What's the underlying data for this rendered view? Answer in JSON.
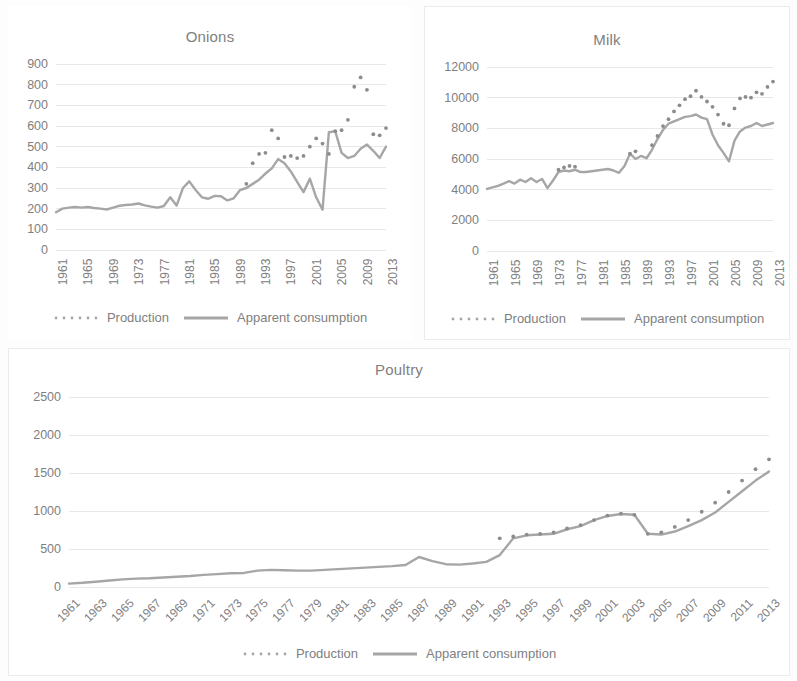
{
  "figure": {
    "legend_labels": {
      "production": "Production",
      "consumption": "Apparent consumption"
    },
    "colors": {
      "series": "#a6a6a6",
      "text": "#808080",
      "gridline": "#e8e8e8",
      "panel_border": "#eceaea",
      "background": "#ffffff"
    }
  },
  "chart_data": [
    {
      "id": "onions",
      "type": "line",
      "title": "Onions",
      "xlabel": "",
      "ylabel": "",
      "ylim": [
        0,
        900
      ],
      "yticks": [
        0,
        100,
        200,
        300,
        400,
        500,
        600,
        700,
        800,
        900
      ],
      "grid": true,
      "legend_position": "bottom",
      "xtick_step": 4,
      "xtick_rotation": -90,
      "xticks": [
        "1961",
        "1965",
        "1969",
        "1973",
        "1977",
        "1981",
        "1985",
        "1989",
        "1993",
        "1997",
        "2001",
        "2005",
        "2009",
        "2013"
      ],
      "x": [
        1961,
        1962,
        1963,
        1964,
        1965,
        1966,
        1967,
        1968,
        1969,
        1970,
        1971,
        1972,
        1973,
        1974,
        1975,
        1976,
        1977,
        1978,
        1979,
        1980,
        1981,
        1982,
        1983,
        1984,
        1985,
        1986,
        1987,
        1988,
        1989,
        1990,
        1991,
        1992,
        1993,
        1994,
        1995,
        1996,
        1997,
        1998,
        1999,
        2000,
        2001,
        2002,
        2003,
        2004,
        2005,
        2006,
        2007,
        2008,
        2009,
        2010,
        2011,
        2012,
        2013
      ],
      "series": [
        {
          "name": "Apparent consumption",
          "style": "solid-line",
          "values": [
            183,
            200,
            205,
            208,
            205,
            208,
            203,
            200,
            196,
            205,
            214,
            218,
            220,
            225,
            216,
            210,
            205,
            213,
            255,
            215,
            300,
            332,
            290,
            255,
            248,
            262,
            260,
            240,
            250,
            290,
            300,
            320,
            340,
            370,
            395,
            440,
            420,
            380,
            330,
            280,
            345,
            255,
            195,
            570,
            575,
            470,
            445,
            455,
            490,
            510,
            480,
            445,
            500,
            470,
            490,
            465,
            455,
            480,
            485,
            560,
            500
          ]
        },
        {
          "name": "Production",
          "style": "dotted",
          "values": [
            null,
            null,
            null,
            null,
            null,
            null,
            null,
            null,
            null,
            null,
            null,
            null,
            null,
            null,
            null,
            null,
            null,
            null,
            null,
            null,
            null,
            null,
            null,
            null,
            null,
            null,
            null,
            null,
            null,
            null,
            320,
            420,
            465,
            470,
            580,
            540,
            450,
            455,
            445,
            455,
            500,
            540,
            515,
            465,
            575,
            580,
            630,
            790,
            835,
            775,
            560,
            555,
            590,
            625,
            660,
            700,
            740,
            715,
            690,
            670,
            640,
            705,
            715
          ]
        }
      ]
    },
    {
      "id": "milk",
      "type": "line",
      "title": "Milk",
      "xlabel": "",
      "ylabel": "",
      "ylim": [
        0,
        12000
      ],
      "yticks": [
        0,
        2000,
        4000,
        6000,
        8000,
        10000,
        12000
      ],
      "grid": true,
      "legend_position": "bottom",
      "xtick_step": 4,
      "xtick_rotation": -90,
      "xticks": [
        "1961",
        "1965",
        "1969",
        "1973",
        "1977",
        "1981",
        "1985",
        "1989",
        "1993",
        "1997",
        "2001",
        "2005",
        "2009",
        "2013"
      ],
      "x": [
        1961,
        1962,
        1963,
        1964,
        1965,
        1966,
        1967,
        1968,
        1969,
        1970,
        1971,
        1972,
        1973,
        1974,
        1975,
        1976,
        1977,
        1978,
        1979,
        1980,
        1981,
        1982,
        1983,
        1984,
        1985,
        1986,
        1987,
        1988,
        1989,
        1990,
        1991,
        1992,
        1993,
        1994,
        1995,
        1996,
        1997,
        1998,
        1999,
        2000,
        2001,
        2002,
        2003,
        2004,
        2005,
        2006,
        2007,
        2008,
        2009,
        2010,
        2011,
        2012,
        2013
      ],
      "series": [
        {
          "name": "Apparent consumption",
          "style": "solid-line",
          "values": [
            4050,
            4150,
            4250,
            4400,
            4550,
            4400,
            4650,
            4500,
            4750,
            4500,
            4700,
            4100,
            4600,
            5150,
            5250,
            5200,
            5300,
            5150,
            5150,
            5200,
            5250,
            5300,
            5350,
            5250,
            5100,
            5550,
            6350,
            6000,
            6200,
            6050,
            6600,
            7300,
            7900,
            8300,
            8450,
            8600,
            8750,
            8800,
            8900,
            8700,
            8600,
            7600,
            6900,
            6400,
            5850,
            7200,
            7800,
            8050,
            8150,
            8350,
            8150,
            8250,
            8350
          ]
        },
        {
          "name": "Production",
          "style": "dotted",
          "values": [
            null,
            null,
            null,
            null,
            null,
            null,
            null,
            null,
            null,
            null,
            null,
            null,
            null,
            5300,
            5450,
            5550,
            5500,
            null,
            null,
            null,
            null,
            null,
            null,
            null,
            null,
            null,
            6350,
            6500,
            null,
            null,
            6900,
            7500,
            8150,
            8600,
            9100,
            9500,
            9900,
            10100,
            10450,
            10050,
            9750,
            9400,
            8900,
            8300,
            8200,
            9300,
            9950,
            10050,
            10000,
            10350,
            10250,
            10700,
            11050
          ]
        }
      ]
    },
    {
      "id": "poultry",
      "type": "line",
      "title": "Poultry",
      "xlabel": "",
      "ylabel": "",
      "ylim": [
        0,
        2500
      ],
      "yticks": [
        0,
        500,
        1000,
        1500,
        2000,
        2500
      ],
      "grid": true,
      "legend_position": "bottom",
      "xtick_step": 2,
      "xtick_rotation": -45,
      "xticks": [
        "1961",
        "1963",
        "1965",
        "1967",
        "1969",
        "1971",
        "1973",
        "1975",
        "1977",
        "1979",
        "1981",
        "1983",
        "1985",
        "1987",
        "1989",
        "1991",
        "1993",
        "1995",
        "1997",
        "1999",
        "2001",
        "2003",
        "2005",
        "2007",
        "2009",
        "2011",
        "2013"
      ],
      "x": [
        1961,
        1962,
        1963,
        1964,
        1965,
        1966,
        1967,
        1968,
        1969,
        1970,
        1971,
        1972,
        1973,
        1974,
        1975,
        1976,
        1977,
        1978,
        1979,
        1980,
        1981,
        1982,
        1983,
        1984,
        1985,
        1986,
        1987,
        1988,
        1989,
        1990,
        1991,
        1992,
        1993,
        1994,
        1995,
        1996,
        1997,
        1998,
        1999,
        2000,
        2001,
        2002,
        2003,
        2004,
        2005,
        2006,
        2007,
        2008,
        2009,
        2010,
        2011,
        2012,
        2013
      ],
      "series": [
        {
          "name": "Apparent consumption",
          "style": "solid-line",
          "values": [
            45,
            55,
            70,
            85,
            100,
            110,
            115,
            125,
            135,
            145,
            160,
            170,
            180,
            185,
            215,
            225,
            220,
            215,
            215,
            225,
            235,
            245,
            255,
            265,
            275,
            290,
            395,
            340,
            300,
            295,
            310,
            330,
            420,
            640,
            680,
            690,
            700,
            760,
            800,
            880,
            935,
            960,
            950,
            700,
            690,
            730,
            800,
            880,
            980,
            1120,
            1260,
            1400,
            1520,
            1550,
            1545
          ]
        },
        {
          "name": "Production",
          "style": "dotted",
          "values": [
            null,
            null,
            null,
            null,
            null,
            null,
            null,
            null,
            null,
            null,
            null,
            null,
            null,
            null,
            null,
            null,
            null,
            null,
            null,
            null,
            null,
            null,
            null,
            null,
            null,
            null,
            null,
            null,
            null,
            null,
            null,
            null,
            640,
            665,
            690,
            700,
            720,
            770,
            815,
            880,
            940,
            965,
            950,
            700,
            720,
            790,
            880,
            990,
            1110,
            1250,
            1400,
            1550,
            1680,
            1800,
            1890
          ]
        }
      ]
    }
  ]
}
